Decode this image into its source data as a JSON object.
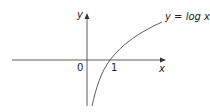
{
  "diagram": {
    "title": "",
    "axes": {
      "x_label": "x",
      "y_label": "y",
      "origin_label": "0"
    },
    "ticks": [
      {
        "label": "1",
        "position": "x-axis"
      }
    ],
    "curve": {
      "equation_label": "y = log x",
      "color": "#333333"
    },
    "colors": {
      "axis": "#333333",
      "background": "#ffffff"
    }
  }
}
